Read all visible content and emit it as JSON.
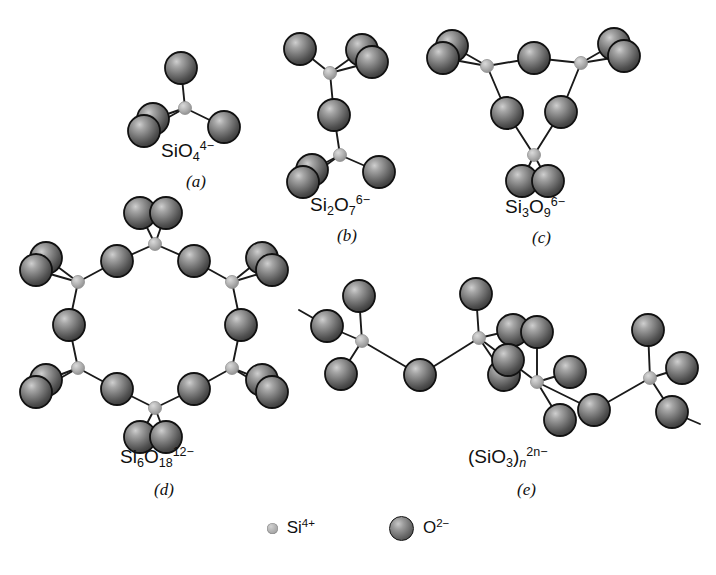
{
  "figure": {
    "background": "#ffffff",
    "bond_color": "#1a1a1a",
    "oxygen_color": "#6e6e6e",
    "oxygen_outline": "#111111",
    "silicon_color": "#b4b4b4"
  },
  "panels": [
    {
      "id": "a",
      "letter": "(a)",
      "formula_parts": {
        "base": "SiO",
        "sub": "4",
        "sup": "4−"
      },
      "name": "orthosilicate-tetrahedron",
      "description": "Single SiO4 tetrahedron",
      "silicon_count": 1,
      "oxygen_count": 4
    },
    {
      "id": "b",
      "letter": "(b)",
      "formula_parts": {
        "base": "Si",
        "base_sub": "2",
        "base2": "O",
        "sub": "7",
        "sup": "6−"
      },
      "name": "pyrosilicate-double-tetrahedron",
      "description": "Two tetrahedra sharing one bridging oxygen",
      "silicon_count": 2,
      "oxygen_count": 7
    },
    {
      "id": "c",
      "letter": "(c)",
      "formula_parts": {
        "base": "Si",
        "base_sub": "3",
        "base2": "O",
        "sub": "9",
        "sup": "6−"
      },
      "name": "cyclic-trisilicate-ring",
      "description": "Three-membered ring of tetrahedra",
      "silicon_count": 3,
      "oxygen_count": 9
    },
    {
      "id": "d",
      "letter": "(d)",
      "formula_parts": {
        "base": "Si",
        "base_sub": "6",
        "base2": "O",
        "sub": "18",
        "sup": "12−"
      },
      "name": "cyclic-hexasilicate-ring",
      "description": "Six-membered ring of tetrahedra",
      "silicon_count": 6,
      "oxygen_count": 18
    },
    {
      "id": "e",
      "letter": "(e)",
      "formula_parts": {
        "open": "(",
        "base": "SiO",
        "sub": "3",
        "close": ")",
        "close_sub": "n",
        "sup": "2n−"
      },
      "name": "single-chain-metasilicate",
      "description": "Infinite single chain of corner-sharing tetrahedra",
      "silicon_count": 4,
      "oxygen_count": 12
    }
  ],
  "legend": {
    "items": [
      {
        "icon": "silicon-sphere-icon",
        "base": "Si",
        "sup": "4+",
        "radius_px": 5.5
      },
      {
        "icon": "oxygen-sphere-icon",
        "base": "O",
        "sup": "2−",
        "radius_px": 12.5
      }
    ]
  },
  "geometry": {
    "o_radius": 16,
    "si_radius": 6.5,
    "panel_a": {
      "si": [
        185,
        108
      ],
      "o": [
        [
          181,
          68
        ],
        [
          153,
          119
        ],
        [
          144,
          131
        ],
        [
          224,
          127
        ]
      ]
    },
    "panel_b": {
      "si": [
        [
          330,
          73
        ],
        [
          340,
          155
        ]
      ],
      "o_bridge": [
        334,
        115
      ],
      "o": [
        [
          300,
          49
        ],
        [
          362,
          50
        ],
        [
          372,
          62
        ],
        [
          312,
          170
        ],
        [
          303,
          182
        ],
        [
          379,
          172
        ]
      ]
    },
    "panel_c": {
      "si": [
        [
          487,
          66
        ],
        [
          581,
          63
        ],
        [
          534,
          155
        ]
      ],
      "o_bridge": [
        [
          534,
          58
        ],
        [
          561,
          112
        ],
        [
          507,
          113
        ]
      ],
      "o": [
        [
          452,
          46
        ],
        [
          443,
          58
        ],
        [
          614,
          44
        ],
        [
          624,
          56
        ],
        [
          522,
          181
        ],
        [
          548,
          181
        ]
      ]
    },
    "panel_d": {
      "si": [
        [
          155,
          244
        ],
        [
          78,
          282
        ],
        [
          78,
          368
        ],
        [
          155,
          408
        ],
        [
          232,
          368
        ],
        [
          232,
          282
        ]
      ],
      "o_bridge": [
        [
          117,
          261
        ],
        [
          69,
          325
        ],
        [
          117,
          389
        ],
        [
          194,
          389
        ],
        [
          241,
          325
        ],
        [
          194,
          261
        ]
      ],
      "o": [
        [
          140,
          213
        ],
        [
          166,
          213
        ],
        [
          46,
          258
        ],
        [
          36,
          270
        ],
        [
          46,
          380
        ],
        [
          36,
          392
        ],
        [
          140,
          437
        ],
        [
          166,
          437
        ],
        [
          262,
          380
        ],
        [
          272,
          392
        ],
        [
          262,
          258
        ],
        [
          272,
          270
        ]
      ]
    },
    "panel_e": {
      "si": [
        [
          362,
          341
        ],
        [
          479,
          338
        ],
        [
          537,
          382
        ],
        [
          650,
          378
        ]
      ],
      "o_bridge": [
        [
          420,
          375
        ],
        [
          508,
          360
        ],
        [
          594,
          410
        ]
      ],
      "o": [
        [
          359,
          296
        ],
        [
          327,
          326
        ],
        [
          341,
          374
        ],
        [
          476,
          294
        ],
        [
          513,
          330
        ],
        [
          504,
          375
        ],
        [
          537,
          332
        ],
        [
          570,
          372
        ],
        [
          560,
          420
        ],
        [
          648,
          330
        ],
        [
          682,
          368
        ],
        [
          672,
          412
        ]
      ],
      "stubs": [
        [
          327,
          326,
          299,
          310
        ],
        [
          672,
          412,
          700,
          424
        ]
      ]
    }
  }
}
